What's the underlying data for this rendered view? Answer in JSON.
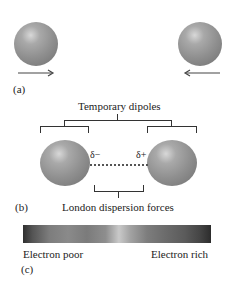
{
  "figure": {
    "panel_a": {
      "label": "(a)",
      "left_arrow_direction": "right",
      "right_arrow_direction": "left"
    },
    "panel_b": {
      "label": "(b)",
      "title": "Temporary dipoles",
      "delta_minus": "δ−",
      "delta_plus": "δ+",
      "caption": "London dispersion forces"
    },
    "panel_c": {
      "label": "(c)",
      "left_label": "Electron poor",
      "right_label": "Electron rich"
    },
    "colors": {
      "sphere": "#8f8f8f",
      "lines": "#333333",
      "background": "#ffffff"
    }
  }
}
